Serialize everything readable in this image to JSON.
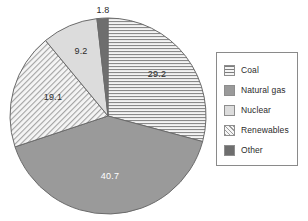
{
  "chart_data": {
    "type": "pie",
    "title": "",
    "subtitle": "",
    "xlabel": "",
    "ylabel": "",
    "grid": false,
    "legend_position": "right",
    "start_angle_deg": 0,
    "direction": "clockwise",
    "units": "percent",
    "categories": [
      "Coal",
      "Natural gas",
      "Renewables",
      "Nuclear",
      "Other"
    ],
    "values": [
      29.2,
      40.7,
      19.1,
      9.2,
      1.8
    ],
    "labels": [
      "29.2",
      "40.7",
      "19.1",
      "9.2",
      "1.8"
    ],
    "slices": [
      {
        "name": "Coal",
        "value": 29.2,
        "label": "29.2",
        "pattern": "horizontal-lines",
        "color": "#f0f0f0",
        "pattern_color": "#7d7d7d",
        "label_color": "#2b2b2b",
        "label_x": 157,
        "label_y": 74,
        "label_inside": true
      },
      {
        "name": "Natural gas",
        "value": 40.7,
        "label": "40.7",
        "pattern": "solid",
        "color": "#9a9a9a",
        "pattern_color": "#9a9a9a",
        "label_color": "#ffffff",
        "label_x": 110,
        "label_y": 176,
        "label_inside": true
      },
      {
        "name": "Renewables",
        "value": 19.1,
        "label": "19.1",
        "pattern": "diagonal-hatch",
        "color": "#f2f2f2",
        "pattern_color": "#9b9b9b",
        "label_color": "#2b2b2b",
        "label_x": 53,
        "label_y": 97,
        "label_inside": true
      },
      {
        "name": "Nuclear",
        "value": 9.2,
        "label": "9.2",
        "pattern": "solid",
        "color": "#dcdcdc",
        "pattern_color": "#dcdcdc",
        "label_color": "#2b2b2b",
        "label_x": 81,
        "label_y": 51,
        "label_inside": true
      },
      {
        "name": "Other",
        "value": 1.8,
        "label": "1.8",
        "pattern": "solid",
        "color": "#6e6e6e",
        "pattern_color": "#6e6e6e",
        "label_color": "#2b2b2b",
        "label_x": 103,
        "label_y": 10,
        "label_inside": false
      }
    ],
    "geometry": {
      "center_x": 108,
      "center_y": 116,
      "radius": 98,
      "outline_color": "#6b6b6b"
    }
  },
  "legend": {
    "border_color": "#8a8a8a",
    "background": "#ffffff",
    "items": [
      {
        "label": "Coal",
        "swatch_class": "sw-coal",
        "swatch_name": "legend-swatch-coal"
      },
      {
        "label": "Natural gas",
        "swatch_class": "sw-natural-gas",
        "swatch_name": "legend-swatch-natural-gas"
      },
      {
        "label": "Nuclear",
        "swatch_class": "sw-nuclear",
        "swatch_name": "legend-swatch-nuclear"
      },
      {
        "label": "Renewables",
        "swatch_class": "sw-renewables",
        "swatch_name": "legend-swatch-renewables"
      },
      {
        "label": "Other",
        "swatch_class": "sw-other",
        "swatch_name": "legend-swatch-other"
      }
    ]
  }
}
